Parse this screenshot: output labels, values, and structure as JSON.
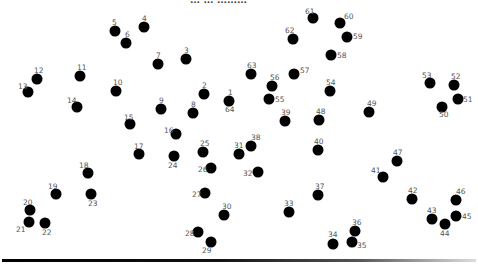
{
  "page": {
    "header_text": "… … ………",
    "background": "#ffffff",
    "dot_color": "#000000",
    "label_color": "#555555"
  },
  "dots": [
    {
      "n": "1",
      "x": 229,
      "y": 101,
      "lx": -1,
      "ly": -12
    },
    {
      "n": "2",
      "x": 204,
      "y": 94,
      "lx": -2,
      "ly": -12
    },
    {
      "n": "3",
      "x": 186,
      "y": 59,
      "lx": -2,
      "ly": -12
    },
    {
      "n": "4",
      "x": 144,
      "y": 27,
      "lx": -2,
      "ly": -12
    },
    {
      "n": "5",
      "x": 115,
      "y": 31,
      "lx": -3,
      "ly": -12
    },
    {
      "n": "6",
      "x": 126,
      "y": 43,
      "lx": -1,
      "ly": -12
    },
    {
      "n": "7",
      "x": 158,
      "y": 64,
      "lx": -2,
      "ly": -12
    },
    {
      "n": "8",
      "x": 193,
      "y": 113,
      "lx": -2,
      "ly": -12
    },
    {
      "n": "9",
      "x": 161,
      "y": 109,
      "lx": -2,
      "ly": -12
    },
    {
      "n": "10",
      "x": 116,
      "y": 91,
      "lx": -3,
      "ly": -12
    },
    {
      "n": "11",
      "x": 80,
      "y": 76,
      "lx": -3,
      "ly": -12
    },
    {
      "n": "12",
      "x": 37,
      "y": 79,
      "lx": -3,
      "ly": -12
    },
    {
      "n": "13",
      "x": 28,
      "y": 92,
      "lx": -10,
      "ly": -9
    },
    {
      "n": "14",
      "x": 77,
      "y": 107,
      "lx": -10,
      "ly": -10
    },
    {
      "n": "15",
      "x": 130,
      "y": 124,
      "lx": -6,
      "ly": -10
    },
    {
      "n": "16",
      "x": 176,
      "y": 134,
      "lx": -12,
      "ly": -7
    },
    {
      "n": "17",
      "x": 139,
      "y": 154,
      "lx": -5,
      "ly": -11
    },
    {
      "n": "18",
      "x": 88,
      "y": 173,
      "lx": -9,
      "ly": -11
    },
    {
      "n": "19",
      "x": 56,
      "y": 194,
      "lx": -8,
      "ly": -11
    },
    {
      "n": "20",
      "x": 30,
      "y": 210,
      "lx": -7,
      "ly": -11
    },
    {
      "n": "21",
      "x": 29,
      "y": 222,
      "lx": -13,
      "ly": 4
    },
    {
      "n": "22",
      "x": 45,
      "y": 223,
      "lx": -3,
      "ly": 6
    },
    {
      "n": "23",
      "x": 91,
      "y": 194,
      "lx": -3,
      "ly": 6
    },
    {
      "n": "24",
      "x": 174,
      "y": 156,
      "lx": -6,
      "ly": 6
    },
    {
      "n": "25",
      "x": 203,
      "y": 152,
      "lx": -3,
      "ly": -12
    },
    {
      "n": "26",
      "x": 211,
      "y": 168,
      "lx": -13,
      "ly": -2
    },
    {
      "n": "27",
      "x": 205,
      "y": 193,
      "lx": -13,
      "ly": -2
    },
    {
      "n": "28",
      "x": 198,
      "y": 232,
      "lx": -13,
      "ly": -2
    },
    {
      "n": "29",
      "x": 211,
      "y": 242,
      "lx": -9,
      "ly": 5
    },
    {
      "n": "30",
      "x": 224,
      "y": 215,
      "lx": -2,
      "ly": -12
    },
    {
      "n": "31",
      "x": 239,
      "y": 154,
      "lx": -5,
      "ly": -12
    },
    {
      "n": "32",
      "x": 258,
      "y": 172,
      "lx": -15,
      "ly": -2
    },
    {
      "n": "33",
      "x": 289,
      "y": 212,
      "lx": -5,
      "ly": -12
    },
    {
      "n": "34",
      "x": 333,
      "y": 244,
      "lx": -5,
      "ly": -13
    },
    {
      "n": "35",
      "x": 352,
      "y": 242,
      "lx": 5,
      "ly": 0
    },
    {
      "n": "36",
      "x": 355,
      "y": 231,
      "lx": -3,
      "ly": -12
    },
    {
      "n": "37",
      "x": 318,
      "y": 195,
      "lx": -3,
      "ly": -12
    },
    {
      "n": "38",
      "x": 251,
      "y": 146,
      "lx": 0,
      "ly": -12
    },
    {
      "n": "39",
      "x": 285,
      "y": 121,
      "lx": -4,
      "ly": -12
    },
    {
      "n": "40",
      "x": 318,
      "y": 150,
      "lx": -4,
      "ly": -12
    },
    {
      "n": "41",
      "x": 383,
      "y": 177,
      "lx": -12,
      "ly": -10
    },
    {
      "n": "42",
      "x": 412,
      "y": 199,
      "lx": -4,
      "ly": -12
    },
    {
      "n": "43",
      "x": 432,
      "y": 219,
      "lx": -5,
      "ly": -12
    },
    {
      "n": "44",
      "x": 445,
      "y": 224,
      "lx": -5,
      "ly": 6
    },
    {
      "n": "45",
      "x": 456,
      "y": 216,
      "lx": 6,
      "ly": -3
    },
    {
      "n": "46",
      "x": 456,
      "y": 200,
      "lx": 0,
      "ly": -12
    },
    {
      "n": "47",
      "x": 397,
      "y": 161,
      "lx": -4,
      "ly": -12
    },
    {
      "n": "48",
      "x": 319,
      "y": 120,
      "lx": -3,
      "ly": -12
    },
    {
      "n": "49",
      "x": 369,
      "y": 112,
      "lx": -2,
      "ly": -12
    },
    {
      "n": "50",
      "x": 442,
      "y": 107,
      "lx": -3,
      "ly": 4
    },
    {
      "n": "51",
      "x": 458,
      "y": 99,
      "lx": 5,
      "ly": -3
    },
    {
      "n": "52",
      "x": 454,
      "y": 85,
      "lx": -3,
      "ly": -12
    },
    {
      "n": "53",
      "x": 430,
      "y": 83,
      "lx": -8,
      "ly": -11
    },
    {
      "n": "54",
      "x": 330,
      "y": 91,
      "lx": -4,
      "ly": -12
    },
    {
      "n": "55",
      "x": 269,
      "y": 99,
      "lx": 6,
      "ly": -3
    },
    {
      "n": "56",
      "x": 272,
      "y": 86,
      "lx": -2,
      "ly": -12
    },
    {
      "n": "57",
      "x": 294,
      "y": 74,
      "lx": 6,
      "ly": -7
    },
    {
      "n": "58",
      "x": 331,
      "y": 55,
      "lx": 6,
      "ly": -3
    },
    {
      "n": "59",
      "x": 347,
      "y": 37,
      "lx": 6,
      "ly": -4
    },
    {
      "n": "60",
      "x": 340,
      "y": 23,
      "lx": 4,
      "ly": -10
    },
    {
      "n": "61",
      "x": 313,
      "y": 18,
      "lx": -8,
      "ly": -10
    },
    {
      "n": "62",
      "x": 293,
      "y": 39,
      "lx": -8,
      "ly": -12
    },
    {
      "n": "63",
      "x": 251,
      "y": 74,
      "lx": -4,
      "ly": -12
    },
    {
      "n": "64",
      "x": 229,
      "y": 101,
      "lx": -4,
      "ly": 5
    }
  ]
}
